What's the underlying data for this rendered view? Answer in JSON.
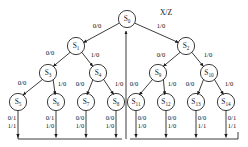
{
  "figure": {
    "type": "state-transition-tree",
    "caption_label": "X/Z",
    "stroke_color": "#1a1a1a",
    "text_color": "#111111",
    "background": "#ffffff",
    "node_radius": 8.6,
    "width": 248,
    "height": 147
  },
  "nodes": [
    {
      "id": "S0",
      "name": "S",
      "sub": "0",
      "cx": 127,
      "cy": 19,
      "level": 0
    },
    {
      "id": "S1",
      "name": "S",
      "sub": "1",
      "cx": 76,
      "cy": 46,
      "level": 1
    },
    {
      "id": "S2",
      "name": "S",
      "sub": "2",
      "cx": 186,
      "cy": 46,
      "level": 1
    },
    {
      "id": "S3",
      "name": "S",
      "sub": "3",
      "cx": 48,
      "cy": 73,
      "level": 2
    },
    {
      "id": "S4",
      "name": "S",
      "sub": "4",
      "cx": 98,
      "cy": 73,
      "level": 2
    },
    {
      "id": "S9",
      "name": "S",
      "sub": "9",
      "cx": 158,
      "cy": 73,
      "level": 2
    },
    {
      "id": "S10",
      "name": "S",
      "sub": "10",
      "cx": 209,
      "cy": 73,
      "level": 2
    },
    {
      "id": "S5",
      "name": "S",
      "sub": "5",
      "cx": 18,
      "cy": 102,
      "level": 3
    },
    {
      "id": "S6",
      "name": "S",
      "sub": "6",
      "cx": 56,
      "cy": 102,
      "level": 3
    },
    {
      "id": "S7",
      "name": "S",
      "sub": "7",
      "cx": 86,
      "cy": 102,
      "level": 3
    },
    {
      "id": "S8",
      "name": "S",
      "sub": "8",
      "cx": 116,
      "cy": 102,
      "level": 3
    },
    {
      "id": "S11",
      "name": "S",
      "sub": "11",
      "cx": 136,
      "cy": 102,
      "level": 3
    },
    {
      "id": "S12",
      "name": "S",
      "sub": "12",
      "cx": 166,
      "cy": 102,
      "level": 3
    },
    {
      "id": "S13",
      "name": "S",
      "sub": "13",
      "cx": 196,
      "cy": 102,
      "level": 3
    },
    {
      "id": "S14",
      "name": "S",
      "sub": "14",
      "cx": 226,
      "cy": 102,
      "level": 3
    }
  ],
  "edges": [
    {
      "from": "S0",
      "to": "S1",
      "label": "0/0",
      "lx": 97,
      "ly": 26
    },
    {
      "from": "S0",
      "to": "S2",
      "label": "1/0",
      "lx": 161,
      "ly": 26
    },
    {
      "from": "S1",
      "to": "S3",
      "label": "0/0",
      "lx": 50,
      "ly": 53
    },
    {
      "from": "S1",
      "to": "S4",
      "label": "1/0",
      "lx": 95,
      "ly": 55
    },
    {
      "from": "S2",
      "to": "S9",
      "label": "0/0",
      "lx": 161,
      "ly": 55
    },
    {
      "from": "S2",
      "to": "S10",
      "label": "1/0",
      "lx": 208,
      "ly": 55
    },
    {
      "from": "S3",
      "to": "S5",
      "label": "0/0",
      "lx": 22,
      "ly": 83
    },
    {
      "from": "S3",
      "to": "S6",
      "label": "1/0",
      "lx": 62,
      "ly": 84
    },
    {
      "from": "S4",
      "to": "S7",
      "label": "0/0",
      "lx": 80,
      "ly": 84
    },
    {
      "from": "S4",
      "to": "S8",
      "label": "1/0",
      "lx": 119,
      "ly": 84
    },
    {
      "from": "S9",
      "to": "S11",
      "label": "0/0",
      "lx": 134,
      "ly": 84
    },
    {
      "from": "S9",
      "to": "S12",
      "label": "1/0",
      "lx": 172,
      "ly": 84
    },
    {
      "from": "S10",
      "to": "S13",
      "label": "0/0",
      "lx": 190,
      "ly": 84
    },
    {
      "from": "S10",
      "to": "S14",
      "label": "1/0",
      "lx": 229,
      "ly": 84
    }
  ],
  "leaf_outputs": [
    {
      "node": "S5",
      "lines": [
        "0/1",
        "1/1"
      ],
      "lx": 12,
      "ly": 114
    },
    {
      "node": "S6",
      "lines": [
        "0/1",
        "1/0"
      ],
      "lx": 50,
      "ly": 114
    },
    {
      "node": "S7",
      "lines": [
        "0/0",
        "1/0"
      ],
      "lx": 80,
      "ly": 114
    },
    {
      "node": "S8",
      "lines": [
        "0/0",
        "1/0"
      ],
      "lx": 110,
      "ly": 114
    },
    {
      "node": "S11",
      "lines": [
        "0/0",
        "1/0"
      ],
      "lx": 142,
      "ly": 114
    },
    {
      "node": "S12",
      "lines": [
        "0/0",
        "1/0"
      ],
      "lx": 172,
      "ly": 114
    },
    {
      "node": "S13",
      "lines": [
        "0/0",
        "1/1"
      ],
      "lx": 202,
      "ly": 114
    },
    {
      "node": "S14",
      "lines": [
        "0/1",
        "1/1"
      ],
      "lx": 232,
      "ly": 114
    }
  ],
  "annotation": {
    "xz_label": "X/Z",
    "xz_x": 166,
    "xz_y": 12
  },
  "return_path": {
    "bus_y": 139,
    "bus_left_x": 18,
    "bus_right_x": 238,
    "riser_x": 126,
    "description": "reset return bus to S0"
  }
}
